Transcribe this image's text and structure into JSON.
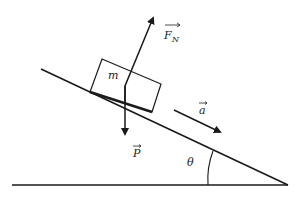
{
  "diagram": {
    "title": "",
    "block_label": "m",
    "normal_force_label": "F",
    "normal_force_subscript": "N",
    "weight_label": "P",
    "acceleration_label": "a",
    "angle_label": "θ",
    "line_color": "#1a1a1a"
  }
}
